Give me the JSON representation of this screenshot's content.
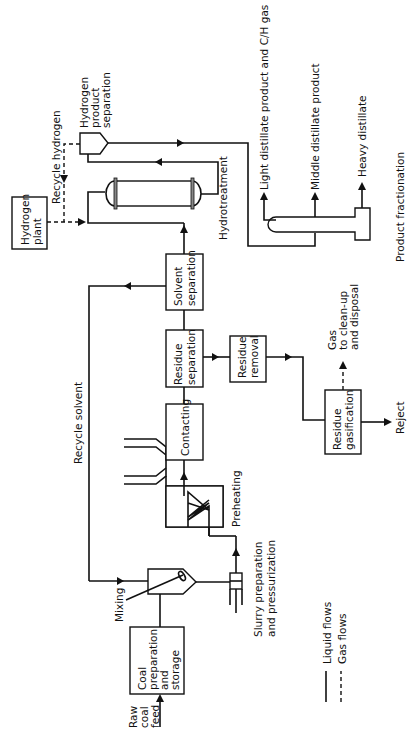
{
  "diagram": {
    "orientation": "rotated 90 degrees counter-clockwise",
    "units": {
      "coal_prep": [
        "Coal",
        "preparation",
        "and",
        "storage"
      ],
      "contacting": "Contacting",
      "residue_separation": [
        "Residue",
        "separation"
      ],
      "solvent_separation": [
        "Solvent",
        "separation"
      ],
      "residue_removal": [
        "Residue",
        "removal"
      ],
      "residue_gasification": [
        "Residue",
        "gasification"
      ],
      "hydrogen_plant": [
        "Hydrogen",
        "plant"
      ]
    },
    "labels": {
      "raw_coal_feed": [
        "Raw",
        "coal",
        "feed"
      ],
      "mixing": "Mixing",
      "slurry": [
        "Slurry preparation",
        "and pressurization"
      ],
      "preheating": "Preheating",
      "recycle_solvent": "Recycle solvent",
      "recycle_hydrogen": "Recycle hydrogen",
      "hydrogen_product_separation": [
        "Hydrogen",
        "product",
        "separation"
      ],
      "hydrotreatment": "Hydrotreatment",
      "light_distillate": "Light distillate product and C/H gas",
      "middle_distillate": "Middle distillate product",
      "heavy_distillate": "Heavy distillate",
      "product_fractionation": "Product fractionation",
      "gas_to_cleanup": [
        "Gas",
        "to clean-up",
        "and disposal"
      ],
      "reject": "Reject"
    },
    "legend": {
      "liquid": "Liquid flows",
      "gas": "Gas flows"
    }
  }
}
